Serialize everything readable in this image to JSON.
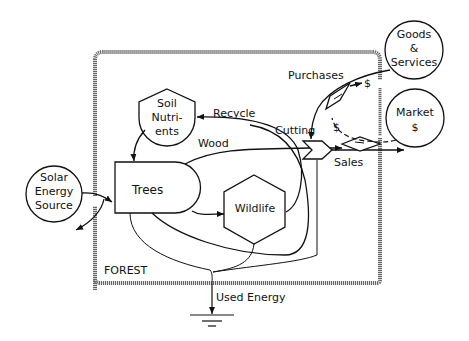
{
  "diagram": {
    "type": "energy-systems-diagram",
    "boundary_label": "FOREST",
    "nodes": {
      "solar": {
        "label_lines": [
          "Solar",
          "Energy",
          "Source"
        ],
        "shape": "circle-source"
      },
      "soil": {
        "label_lines": [
          "Soil",
          "Nutri-",
          "ents"
        ],
        "shape": "storage-tank"
      },
      "trees": {
        "label": "Trees",
        "shape": "producer"
      },
      "wildlife": {
        "label": "Wildlife",
        "shape": "consumer-hexagon"
      },
      "goods": {
        "label_lines": [
          "Goods",
          "&",
          "Services"
        ],
        "shape": "circle-source"
      },
      "market": {
        "label_lines": [
          "Market",
          "$"
        ],
        "shape": "circle-source"
      },
      "cutting": {
        "label": "Cutting",
        "shape": "interaction"
      },
      "sales": {
        "label": "Sales",
        "shape": "transaction"
      },
      "purchases": {
        "label": "Purchases",
        "shape": "transaction"
      }
    },
    "flows": {
      "recycle": "Recycle",
      "wood": "Wood",
      "used_energy": "Used Energy",
      "dollar_1": "$",
      "dollar_2": "$"
    }
  }
}
